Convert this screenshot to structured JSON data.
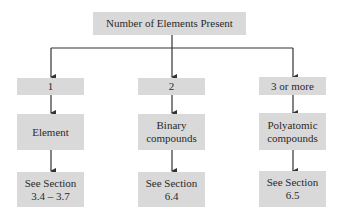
{
  "diagram": {
    "root": {
      "label": "Number of Elements Present"
    },
    "columns": [
      {
        "count_label": "1",
        "category_lines": [
          "Element"
        ],
        "reference_lines": [
          "See Section",
          "3.4 – 3.7"
        ]
      },
      {
        "count_label": "2",
        "category_lines": [
          "Binary",
          "compounds"
        ],
        "reference_lines": [
          "See Section",
          "6.4"
        ]
      },
      {
        "count_label": "3 or more",
        "category_lines": [
          "Polyatomic",
          "compounds"
        ],
        "reference_lines": [
          "See Section",
          "6.5"
        ]
      }
    ],
    "colors": {
      "box_fill": "#d9d9d9",
      "line": "#333333",
      "text": "#2a2a2a"
    }
  }
}
